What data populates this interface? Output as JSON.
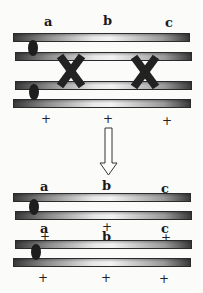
{
  "diagram": {
    "top": {
      "gene_labels": [
        "a",
        "b",
        "c"
      ],
      "wildtype_labels": [
        "+",
        "+",
        "+"
      ],
      "crossovers": 2
    },
    "arrow": "down-arrow",
    "bottom": {
      "pair1": {
        "gene_labels": [
          "a",
          "b",
          "c"
        ],
        "lower_labels": [
          "+"
        ]
      },
      "pair2": {
        "top_labels": [
          "a",
          "c",
          "+",
          "+"
        ],
        "mid_label": "b",
        "lower_labels": [
          "+",
          "+",
          "+"
        ]
      }
    },
    "colors": {
      "chromatid_dark": "#3a3a3a",
      "chromatid_light": "#f2f2f2",
      "centromere": "#1e1e1e",
      "background": "#fbfbfa"
    }
  }
}
